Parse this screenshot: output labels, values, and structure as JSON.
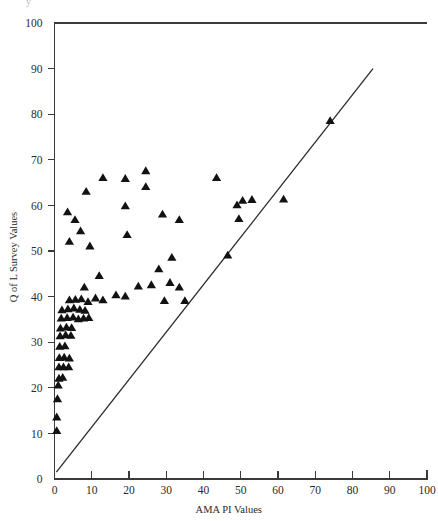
{
  "figure": {
    "top_fragment": "y",
    "background_color": "#ffffff",
    "marker_color": "#121212",
    "axis_color": "#3a3a3a",
    "line_color": "#2a2a2a"
  },
  "chart_data": {
    "type": "scatter",
    "title": "",
    "xlabel": "AMA PI Values",
    "ylabel": "Q of L Survey Values",
    "xlim": [
      0,
      100
    ],
    "ylim": [
      0,
      100
    ],
    "xticks": [
      0,
      10,
      20,
      30,
      40,
      50,
      60,
      70,
      80,
      90,
      100
    ],
    "yticks": [
      0,
      10,
      20,
      30,
      40,
      50,
      60,
      70,
      80,
      90,
      100
    ],
    "xtick_labels": [
      "0",
      "10",
      "20",
      "30",
      "40",
      "50",
      "60",
      "70",
      "80",
      "90",
      "100"
    ],
    "ytick_labels": [
      "0",
      "10",
      "20",
      "30",
      "40",
      "50",
      "60",
      "70",
      "80",
      "90",
      "100"
    ],
    "grid": false,
    "legend": null,
    "marker": "triangle-up",
    "reference_line": {
      "label": "identity-line",
      "x": [
        0.5,
        85.5
      ],
      "y": [
        1.5,
        90.0
      ]
    },
    "series": [
      {
        "name": "Patients",
        "marker": "triangle-up",
        "color": "#121212",
        "points": [
          [
            0.6,
            10.5
          ],
          [
            0.6,
            13.5
          ],
          [
            0.8,
            17.5
          ],
          [
            1.0,
            20.5
          ],
          [
            1.2,
            22.0
          ],
          [
            2.2,
            22.2
          ],
          [
            1.2,
            24.5
          ],
          [
            2.4,
            24.5
          ],
          [
            3.8,
            24.5
          ],
          [
            1.3,
            26.5
          ],
          [
            2.6,
            26.6
          ],
          [
            4.0,
            26.4
          ],
          [
            1.4,
            29.0
          ],
          [
            2.8,
            29.1
          ],
          [
            1.5,
            31.3
          ],
          [
            3.0,
            31.5
          ],
          [
            4.4,
            31.4
          ],
          [
            1.6,
            33.0
          ],
          [
            3.2,
            33.2
          ],
          [
            4.6,
            33.1
          ],
          [
            1.8,
            35.2
          ],
          [
            3.4,
            35.3
          ],
          [
            5.0,
            35.4
          ],
          [
            6.4,
            35.0
          ],
          [
            7.8,
            35.2
          ],
          [
            9.2,
            35.3
          ],
          [
            2.0,
            37.0
          ],
          [
            3.6,
            37.2
          ],
          [
            5.2,
            37.4
          ],
          [
            6.8,
            37.1
          ],
          [
            8.2,
            36.9
          ],
          [
            4.0,
            39.2
          ],
          [
            5.6,
            39.3
          ],
          [
            7.2,
            39.4
          ],
          [
            9.0,
            38.8
          ],
          [
            11.0,
            39.6
          ],
          [
            13.0,
            39.2
          ],
          [
            16.5,
            40.3
          ],
          [
            19.0,
            40.0
          ],
          [
            8.0,
            42.0
          ],
          [
            22.5,
            42.2
          ],
          [
            26.0,
            42.5
          ],
          [
            31.0,
            43.0
          ],
          [
            33.5,
            42.0
          ],
          [
            29.5,
            39.0
          ],
          [
            35.0,
            39.0
          ],
          [
            12.0,
            44.5
          ],
          [
            28.0,
            46.0
          ],
          [
            31.5,
            48.5
          ],
          [
            46.5,
            49.0
          ],
          [
            9.5,
            51.0
          ],
          [
            4.0,
            52.0
          ],
          [
            7.0,
            54.3
          ],
          [
            19.5,
            53.5
          ],
          [
            5.5,
            56.8
          ],
          [
            33.5,
            56.8
          ],
          [
            49.5,
            57.0
          ],
          [
            3.5,
            58.5
          ],
          [
            29.0,
            58.0
          ],
          [
            19.0,
            59.8
          ],
          [
            49.0,
            60.0
          ],
          [
            50.5,
            61.0
          ],
          [
            53.0,
            61.2
          ],
          [
            61.5,
            61.3
          ],
          [
            8.5,
            63.0
          ],
          [
            24.5,
            64.0
          ],
          [
            19.0,
            65.8
          ],
          [
            43.5,
            66.0
          ],
          [
            13.0,
            66.0
          ],
          [
            24.5,
            67.5
          ],
          [
            74.0,
            78.5
          ]
        ]
      }
    ],
    "point_count": 71
  }
}
